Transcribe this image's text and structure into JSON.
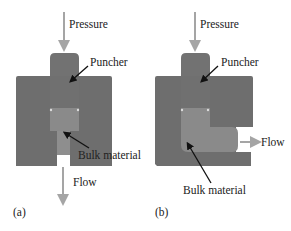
{
  "panels": [
    {
      "id": "a",
      "tag": "(a)",
      "pressure_label": "Pressure",
      "puncher_label": "Puncher",
      "bulk_label": "Bulk material",
      "flow_label": "Flow"
    },
    {
      "id": "b",
      "tag": "(b)",
      "pressure_label": "Pressure",
      "puncher_label": "Puncher",
      "bulk_label": "Bulk material",
      "flow_label": "Flow"
    }
  ],
  "colors": {
    "die": "#6e6e6e",
    "punch": "#737373",
    "bulk": "#8c8c8c",
    "arrow_gray": "#a5a5a5",
    "pointer": "#111111"
  }
}
